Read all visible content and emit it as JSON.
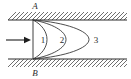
{
  "figure": {
    "type": "diagram",
    "background_color": "#ffffff",
    "line_color": "#2b2b2b",
    "hatch_color": "#4a4a4a",
    "width": 131,
    "height": 79
  },
  "walls": {
    "top": {
      "label": "A",
      "label_x": 35,
      "label_y": 9,
      "line_y": 20,
      "x_start": 8,
      "x_end": 127,
      "hatch_side": "above",
      "hatch_height": 8
    },
    "bottom": {
      "label": "B",
      "label_x": 35,
      "label_y": 76,
      "line_y": 59,
      "x_start": 8,
      "x_end": 127,
      "hatch_side": "below",
      "hatch_height": 8
    }
  },
  "inlet": {
    "arrow_label": "",
    "shaft_x_start": 6,
    "shaft_x_end": 28,
    "shaft_y": 40,
    "head_length": 6,
    "head_half_width": 3.2
  },
  "entrance_line": {
    "x": 33,
    "y_top": 20,
    "y_bottom": 59
  },
  "profiles": [
    {
      "id": "1",
      "label": "1",
      "apex_x": 47,
      "label_x": 43,
      "label_y": 43,
      "origin_x": 33,
      "y_top": 20,
      "y_bottom": 59
    },
    {
      "id": "2",
      "label": "2",
      "apex_x": 66,
      "label_x": 62,
      "label_y": 43,
      "origin_x": 33,
      "y_top": 20,
      "y_bottom": 59
    },
    {
      "id": "3",
      "label": "3",
      "apex_x": 89,
      "label_x": 96,
      "label_y": 43,
      "origin_x": 33,
      "y_top": 20,
      "y_bottom": 59
    }
  ],
  "labels": {
    "top_wall": "A",
    "bottom_wall": "B",
    "zone_one": "1",
    "zone_two": "2",
    "zone_three": "3"
  }
}
